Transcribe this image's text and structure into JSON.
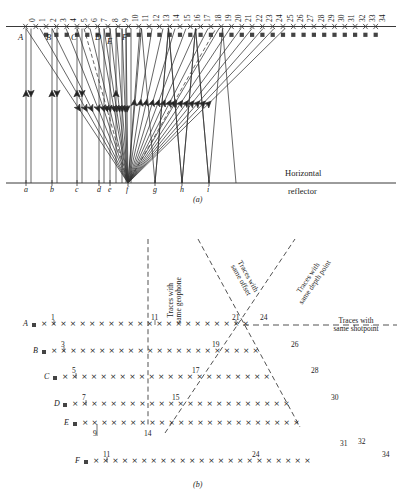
{
  "figure": {
    "panel_a_label": "(a)",
    "panel_b_label": "(b)",
    "reflector_label_line1": "Horizontal",
    "reflector_label_line2": "reflector"
  },
  "panel_a": {
    "surface_station_numbers": [
      "0",
      "1",
      "2",
      "3",
      "4",
      "5",
      "6",
      "7",
      "8",
      "9",
      "10",
      "11",
      "12",
      "13",
      "14",
      "15",
      "16",
      "17",
      "18",
      "19",
      "20",
      "21",
      "22",
      "23",
      "24",
      "25",
      "26",
      "27",
      "28",
      "29",
      "30",
      "31",
      "32",
      "33",
      "34"
    ],
    "shotpoint_letters": [
      "A",
      "B",
      "C",
      "D",
      "E",
      "F"
    ],
    "reflection_point_letters": [
      "a",
      "b",
      "c",
      "d",
      "e",
      "f",
      "g",
      "h",
      "i"
    ]
  },
  "panel_b": {
    "row_letters": [
      "A",
      "B",
      "C",
      "D",
      "E",
      "F"
    ],
    "rows": [
      {
        "letter": "A",
        "start_number": "1",
        "mid_number": "11",
        "marks": [
          {
            "n": "21"
          },
          {
            "n": "24"
          }
        ]
      },
      {
        "letter": "B",
        "start_number": "3",
        "mid_number": "19",
        "end_number": "26"
      },
      {
        "letter": "C",
        "start_number": "5",
        "mid_number": "17",
        "end_number": "28"
      },
      {
        "letter": "D",
        "start_number": "7",
        "mid_number": "15",
        "end_number": "30"
      },
      {
        "letter": "E",
        "start_number": "9",
        "mid_number": "14",
        "end_number_1": "31",
        "end_number_2": "32"
      },
      {
        "letter": "F",
        "start_number": "11",
        "mid_number": "24",
        "end_number": "34"
      }
    ],
    "annotations": {
      "same_geophone_line1": "Traces with",
      "same_geophone_line2": "same geophone",
      "same_offset_line1": "Traces with",
      "same_offset_line2": "same offset",
      "same_depth_point_line1": "Traces with",
      "same_depth_point_line2": "same depth point",
      "same_shotpoint_line1": "Traces with",
      "same_shotpoint_line2": "same shotpoint"
    }
  },
  "colors": {
    "ink": "#1a1a1a",
    "ray": "#333333",
    "mark": "#222222"
  }
}
